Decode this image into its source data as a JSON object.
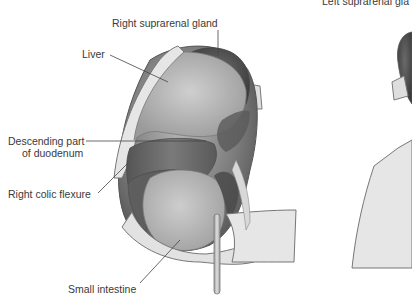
{
  "diagram": {
    "type": "anatomical-illustration",
    "colors": {
      "background": "#ffffff",
      "label_text": "#3a3a3a",
      "leader_line": "#444444",
      "kidney_dark": "#4d4d4d",
      "organ_mid": "#9a9a9a",
      "organ_light": "#c8c8c8",
      "peritoneum_pale": "#e4e4e4",
      "outline": "#6e6e6e"
    },
    "labels": {
      "right_suprarenal_gland": "Right suprarenal gland",
      "left_suprarenal_gland": "Left suprarenal gla",
      "liver": "Liver",
      "descending_duodenum_line1": "Descending part",
      "descending_duodenum_line2": "of duodenum",
      "right_colic_flexure": "Right colic flexure",
      "small_intestine": "Small intestine"
    },
    "panels": [
      {
        "name": "right-kidney",
        "position": "left-center"
      },
      {
        "name": "left-kidney",
        "position": "right-edge-cropped"
      }
    ]
  }
}
